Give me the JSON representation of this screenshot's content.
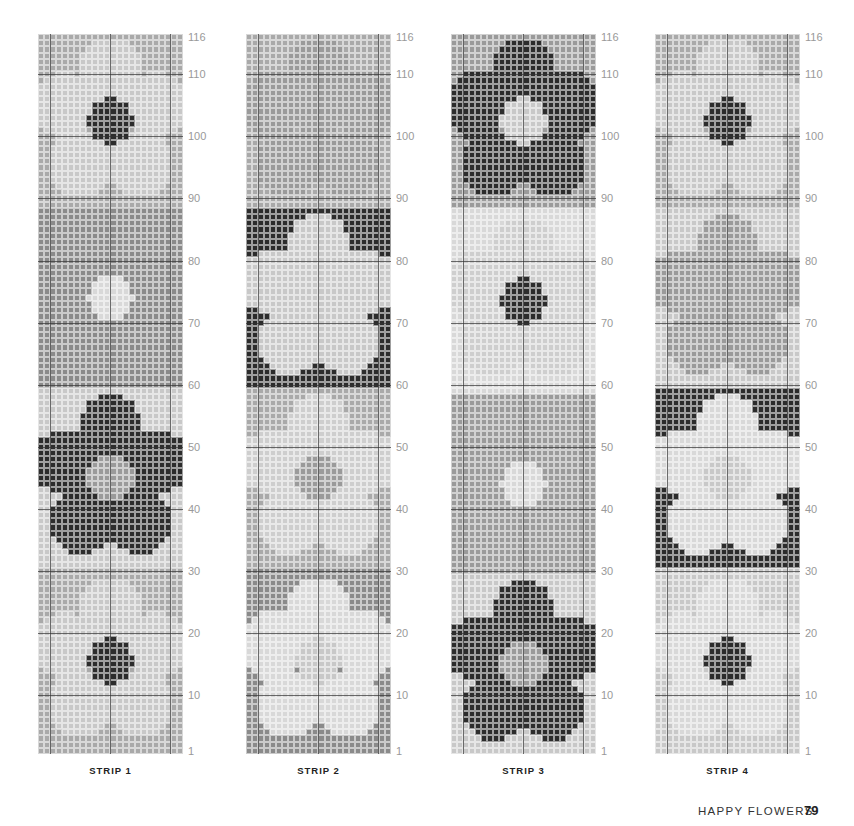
{
  "colors": {
    "A": "#a9a9a9",
    "B": "#c8c8c8",
    "C": "#8a8a8a",
    "D": "#2c2c2c",
    "E": "#d8d8d8",
    "F": "#b8b8b8",
    "G": "#9a9a9a"
  },
  "tick_labels": [
    "116",
    "110",
    "100",
    "90",
    "80",
    "70",
    "60",
    "50",
    "40",
    "30",
    "20",
    "10",
    "1"
  ],
  "tick_rows": [
    116,
    110,
    100,
    90,
    80,
    70,
    60,
    50,
    40,
    30,
    20,
    10,
    1
  ],
  "strips": [
    {
      "label": "STRIP 1",
      "left": 38,
      "blocks": [
        {
          "from": 89,
          "to": 116,
          "bg": "A",
          "petal": "B",
          "center": "D",
          "type": "dot"
        },
        {
          "from": 60,
          "to": 88,
          "bg": "C",
          "petal": "C",
          "center": "E",
          "type": "dot"
        },
        {
          "from": 31,
          "to": 59,
          "bg": "B",
          "petal": "D",
          "center": "G",
          "type": "flower"
        },
        {
          "from": 1,
          "to": 30,
          "bg": "A",
          "petal": "B",
          "center": "D",
          "type": "dot"
        }
      ]
    },
    {
      "label": "STRIP 2",
      "left": 246,
      "blocks": [
        {
          "from": 89,
          "to": 116,
          "bg": "A",
          "petal": "G",
          "center": "G",
          "type": "flower"
        },
        {
          "from": 60,
          "to": 88,
          "bg": "D",
          "petal": "B",
          "center": "B",
          "type": "flower"
        },
        {
          "from": 31,
          "to": 59,
          "bg": "A",
          "petal": "B",
          "center": "G",
          "type": "soft"
        },
        {
          "from": 1,
          "to": 30,
          "bg": "C",
          "petal": "E",
          "center": "B",
          "type": "flower"
        }
      ]
    },
    {
      "label": "STRIP 3",
      "left": 451,
      "blocks": [
        {
          "from": 89,
          "to": 116,
          "bg": "G",
          "petal": "D",
          "center": "B",
          "type": "flower"
        },
        {
          "from": 59,
          "to": 88,
          "bg": "E",
          "petal": "B",
          "center": "D",
          "type": "soft"
        },
        {
          "from": 30,
          "to": 58,
          "bg": "G",
          "petal": "G",
          "center": "E",
          "type": "dot"
        },
        {
          "from": 1,
          "to": 29,
          "bg": "B",
          "petal": "D",
          "center": "G",
          "type": "flower"
        }
      ]
    },
    {
      "label": "STRIP 4",
      "left": 655,
      "blocks": [
        {
          "from": 89,
          "to": 116,
          "bg": "A",
          "petal": "B",
          "center": "D",
          "type": "dot"
        },
        {
          "from": 60,
          "to": 88,
          "bg": "B",
          "petal": "G",
          "center": "G",
          "type": "flower"
        },
        {
          "from": 31,
          "to": 59,
          "bg": "D",
          "petal": "E",
          "center": "B",
          "type": "flower"
        },
        {
          "from": 1,
          "to": 30,
          "bg": "B",
          "petal": "E",
          "center": "D",
          "type": "dot"
        }
      ]
    }
  ],
  "footer": {
    "title": "HAPPY FLOWERS",
    "page": "79"
  }
}
